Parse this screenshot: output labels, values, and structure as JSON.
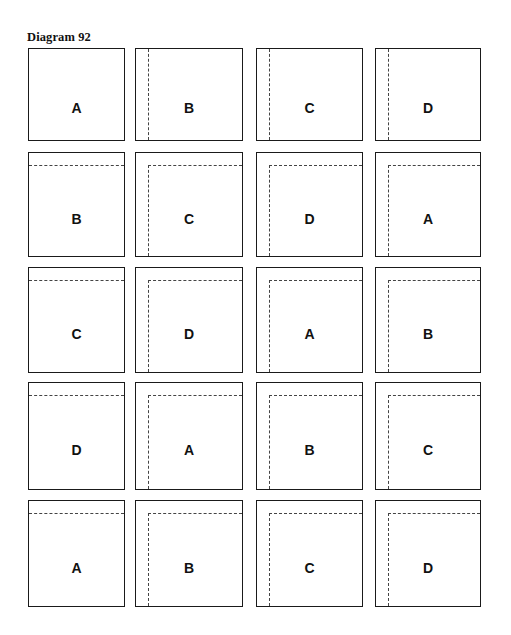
{
  "title": "Diagram 92",
  "layout": {
    "cols": [
      {
        "x": 28,
        "w": 97
      },
      {
        "x": 135,
        "w": 108
      },
      {
        "x": 256,
        "w": 107
      },
      {
        "x": 375,
        "w": 106
      }
    ],
    "rows": [
      {
        "y": 48,
        "h": 93
      },
      {
        "y": 152,
        "h": 105
      },
      {
        "y": 267,
        "h": 106
      },
      {
        "y": 382,
        "h": 108
      },
      {
        "y": 500,
        "h": 107
      }
    ]
  },
  "grid": [
    [
      {
        "label": "A",
        "dash": "none"
      },
      {
        "label": "B",
        "dash": "vertical"
      },
      {
        "label": "C",
        "dash": "vertical"
      },
      {
        "label": "D",
        "dash": "vertical"
      }
    ],
    [
      {
        "label": "B",
        "dash": "horizontal"
      },
      {
        "label": "C",
        "dash": "corner"
      },
      {
        "label": "D",
        "dash": "corner"
      },
      {
        "label": "A",
        "dash": "corner"
      }
    ],
    [
      {
        "label": "C",
        "dash": "horizontal"
      },
      {
        "label": "D",
        "dash": "corner"
      },
      {
        "label": "A",
        "dash": "corner"
      },
      {
        "label": "B",
        "dash": "corner"
      }
    ],
    [
      {
        "label": "D",
        "dash": "horizontal"
      },
      {
        "label": "A",
        "dash": "corner"
      },
      {
        "label": "B",
        "dash": "corner"
      },
      {
        "label": "C",
        "dash": "corner"
      }
    ],
    [
      {
        "label": "A",
        "dash": "horizontal"
      },
      {
        "label": "B",
        "dash": "corner"
      },
      {
        "label": "C",
        "dash": "corner"
      },
      {
        "label": "D",
        "dash": "corner"
      }
    ]
  ]
}
